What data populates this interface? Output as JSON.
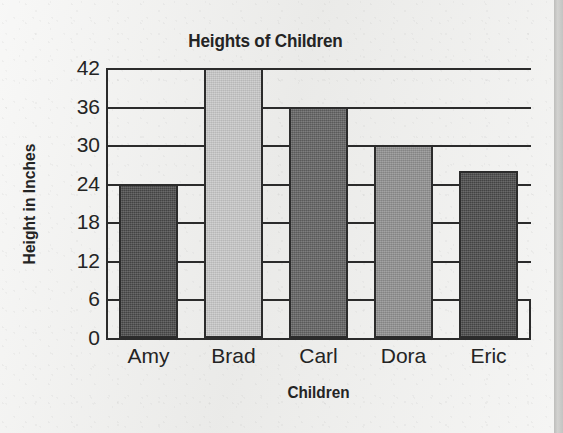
{
  "chart_data": {
    "type": "bar",
    "title": "Heights of Children",
    "xlabel": "Children",
    "ylabel": "Height in Inches",
    "categories": [
      "Amy",
      "Brad",
      "Carl",
      "Dora",
      "Eric"
    ],
    "values": [
      24,
      42,
      36,
      30,
      26
    ],
    "bar_colors": [
      "#4a4a4a",
      "#c8c8c8",
      "#636363",
      "#909090",
      "#4a4a4a"
    ],
    "ylim": [
      0,
      42
    ],
    "ytick_labels": [
      "42",
      "36",
      "30",
      "24",
      "18",
      "12",
      "6",
      "0"
    ],
    "ytick_values": [
      42,
      36,
      30,
      24,
      18,
      12,
      6,
      0
    ],
    "ytick_step": 6,
    "grid": true,
    "legend": null,
    "axis_color": "#2b2b2b",
    "text_color": "#242424",
    "background": "#efefed"
  }
}
